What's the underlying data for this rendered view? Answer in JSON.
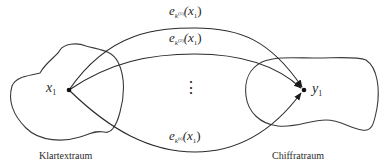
{
  "diagram": {
    "spaces": {
      "plaintext": {
        "label": "Klartextraum"
      },
      "ciphertext": {
        "label": "Chiffratraum"
      }
    },
    "points": {
      "source": {
        "var": "x",
        "index": "1"
      },
      "target": {
        "var": "y",
        "index": "1"
      }
    },
    "mappings": [
      {
        "fn": "e",
        "key": "k",
        "key_index": "(1)",
        "arg": "(x",
        "arg_index": "1",
        "close": ")"
      },
      {
        "fn": "e",
        "key": "k",
        "key_index": "(2)",
        "arg": "(x",
        "arg_index": "1",
        "close": ")"
      },
      {
        "fn": "e",
        "key": "k",
        "key_index": "(t)",
        "arg": "(x",
        "arg_index": "1",
        "close": ")"
      }
    ],
    "ellipsis": "⋮"
  }
}
